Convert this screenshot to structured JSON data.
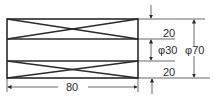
{
  "drawing": {
    "dimensions": {
      "top_thickness": "20",
      "inner_diameter": "φ30",
      "outer_diameter": "φ70",
      "bottom_thickness": "20",
      "length": "80"
    },
    "colors": {
      "stroke": "#2a2a2a",
      "background": "#ffffff"
    }
  }
}
